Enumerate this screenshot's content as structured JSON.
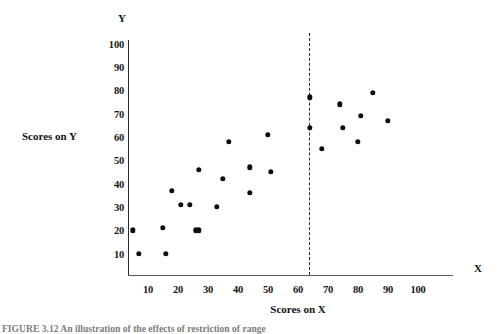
{
  "figure": {
    "caption": "FIGURE 3.12   An illustration of the effects of restriction of range"
  },
  "axis_titles": {
    "y_letter": "Y",
    "x_letter": "X",
    "y_text": "Scores on Y",
    "x_text": "Scores on X"
  },
  "chart_data": {
    "type": "scatter",
    "title": "",
    "xlabel": "Scores on X",
    "ylabel": "Scores on Y",
    "xlim": [
      0,
      105
    ],
    "ylim": [
      0,
      105
    ],
    "xticks": [
      10,
      20,
      30,
      40,
      50,
      60,
      70,
      80,
      90,
      100
    ],
    "yticks": [
      10,
      20,
      30,
      40,
      50,
      60,
      70,
      80,
      90,
      100
    ],
    "grid": false,
    "legend": null,
    "annotations": [
      {
        "type": "vertical-dashed-line",
        "x": 60,
        "label": ""
      }
    ],
    "points": [
      {
        "x": 5,
        "y": 20
      },
      {
        "x": 7,
        "y": 10
      },
      {
        "x": 15,
        "y": 21
      },
      {
        "x": 16,
        "y": 10
      },
      {
        "x": 18,
        "y": 37
      },
      {
        "x": 21,
        "y": 31
      },
      {
        "x": 24,
        "y": 31
      },
      {
        "x": 26,
        "y": 20
      },
      {
        "x": 27,
        "y": 46
      },
      {
        "x": 27,
        "y": 20
      },
      {
        "x": 33,
        "y": 30
      },
      {
        "x": 35,
        "y": 42
      },
      {
        "x": 37,
        "y": 58
      },
      {
        "x": 44,
        "y": 47
      },
      {
        "x": 44,
        "y": 36
      },
      {
        "x": 50,
        "y": 61
      },
      {
        "x": 51,
        "y": 45
      },
      {
        "x": 64,
        "y": 77
      },
      {
        "x": 64,
        "y": 64
      },
      {
        "x": 68,
        "y": 55
      },
      {
        "x": 74,
        "y": 74
      },
      {
        "x": 75,
        "y": 64
      },
      {
        "x": 80,
        "y": 58
      },
      {
        "x": 81,
        "y": 69
      },
      {
        "x": 85,
        "y": 79
      },
      {
        "x": 90,
        "y": 67
      }
    ]
  }
}
